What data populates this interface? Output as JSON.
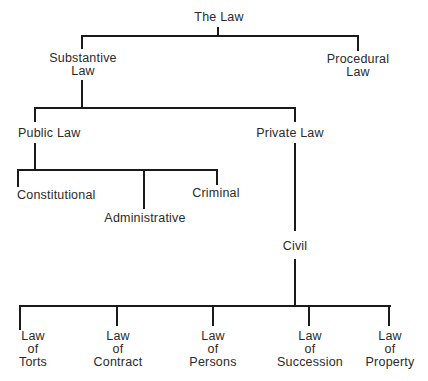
{
  "diagram": {
    "type": "hierarchy-tree",
    "line_color": "#1a1a1a",
    "text_color": "#2a2a2a",
    "nodes": {
      "root": {
        "lines": [
          "The Law"
        ]
      },
      "substantive": {
        "lines": [
          "Substantive",
          "Law"
        ]
      },
      "procedural": {
        "lines": [
          "Procedural",
          "Law"
        ]
      },
      "public": {
        "lines": [
          "Public Law"
        ]
      },
      "private": {
        "lines": [
          "Private Law"
        ]
      },
      "constitutional": {
        "lines": [
          "Constitutional"
        ]
      },
      "administrative": {
        "lines": [
          "Administrative"
        ]
      },
      "criminal": {
        "lines": [
          "Criminal"
        ]
      },
      "civil": {
        "lines": [
          "Civil"
        ]
      },
      "torts": {
        "lines": [
          "Law",
          "of",
          "Torts"
        ]
      },
      "contract": {
        "lines": [
          "Law",
          "of",
          "Contract"
        ]
      },
      "persons": {
        "lines": [
          "Law",
          "of",
          "Persons"
        ]
      },
      "succession": {
        "lines": [
          "Law",
          "of",
          "Succession"
        ]
      },
      "property": {
        "lines": [
          "Law",
          "of",
          "Property"
        ]
      }
    },
    "edges": [
      [
        "The Law",
        "Substantive Law"
      ],
      [
        "The Law",
        "Procedural Law"
      ],
      [
        "Substantive Law",
        "Public Law"
      ],
      [
        "Substantive Law",
        "Private Law"
      ],
      [
        "Public Law",
        "Constitutional"
      ],
      [
        "Public Law",
        "Administrative"
      ],
      [
        "Public Law",
        "Criminal"
      ],
      [
        "Private Law",
        "Civil"
      ],
      [
        "Civil",
        "Law of Torts"
      ],
      [
        "Civil",
        "Law of Contract"
      ],
      [
        "Civil",
        "Law of Persons"
      ],
      [
        "Civil",
        "Law of Succession"
      ],
      [
        "Civil",
        "Law of Property"
      ]
    ]
  }
}
